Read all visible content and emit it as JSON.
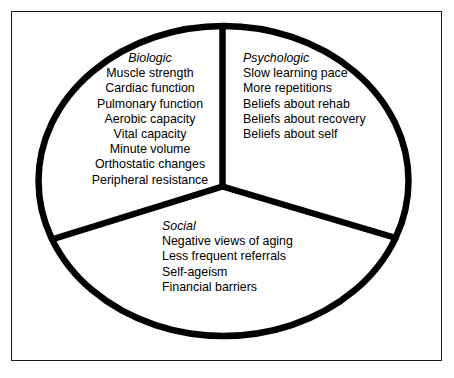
{
  "figure": {
    "title": "",
    "type": "pie-sector-category-diagram",
    "background_color": "#ffffff",
    "stroke_color": "#000000",
    "frame_color": "#1b1b1b"
  },
  "sectors": [
    {
      "id": "biologic",
      "heading": "Biologic",
      "items": [
        "Muscle strength",
        "Cardiac function",
        "Pulmonary function",
        "Aerobic capacity",
        "Vital capacity",
        "Minute volume",
        "Orthostatic changes",
        "Peripheral resistance"
      ]
    },
    {
      "id": "psychologic",
      "heading": "Psychologic",
      "items": [
        "Slow learning pace",
        "More repetitions",
        "Beliefs about rehab",
        "Beliefs about recovery",
        "Beliefs about self"
      ]
    },
    {
      "id": "social",
      "heading": "Social",
      "items": [
        "Negative views of aging",
        "Less frequent referrals",
        "Self-ageism",
        "Financial barriers"
      ]
    }
  ]
}
